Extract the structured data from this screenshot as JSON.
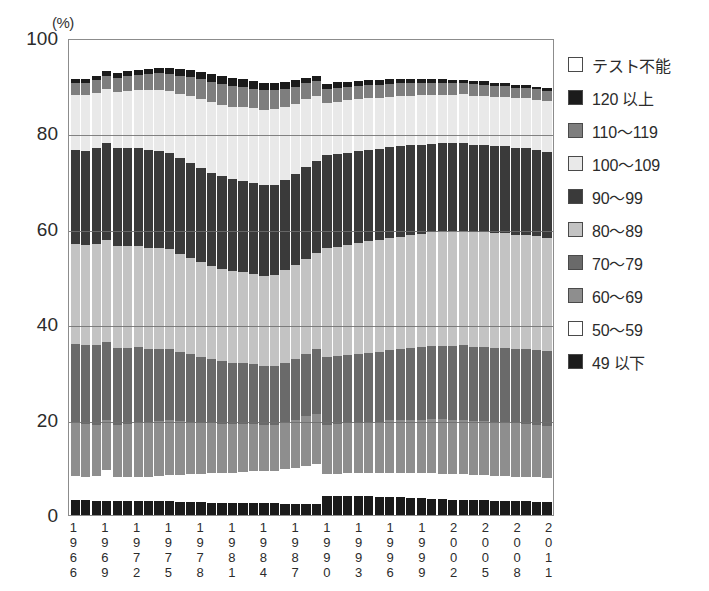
{
  "chart_data": {
    "type": "bar",
    "subtype": "stacked-100-percent",
    "title": "",
    "xlabel": "",
    "ylabel": "",
    "unit_label": "(%)",
    "ylim": [
      0,
      100
    ],
    "yticks": [
      0,
      20,
      40,
      60,
      80,
      100
    ],
    "ytick_labels": [
      "0",
      "20",
      "40",
      "60",
      "80",
      "100"
    ],
    "grid": true,
    "legend_position": "right",
    "x": [
      1966,
      1967,
      1968,
      1969,
      1970,
      1971,
      1972,
      1973,
      1974,
      1975,
      1976,
      1977,
      1978,
      1979,
      1980,
      1981,
      1982,
      1983,
      1984,
      1985,
      1986,
      1987,
      1988,
      1989,
      1990,
      1991,
      1992,
      1993,
      1994,
      1995,
      1996,
      1997,
      1998,
      1999,
      2000,
      2001,
      2002,
      2003,
      2004,
      2005,
      2006,
      2007,
      2008,
      2009,
      2010,
      2011
    ],
    "xtick_labels": [
      "1966",
      "1969",
      "1972",
      "1975",
      "1978",
      "1981",
      "1984",
      "1987",
      "1990",
      "1993",
      "1996",
      "1999",
      "2002",
      "2005",
      "2008",
      "2011"
    ],
    "xtick_indices": [
      0,
      3,
      6,
      9,
      12,
      15,
      18,
      21,
      24,
      27,
      30,
      33,
      36,
      39,
      42,
      45
    ],
    "series": [
      {
        "name": "49 以下",
        "key": "le49",
        "color": "#1b1b1b",
        "fill": "f-black",
        "values": [
          3.2,
          3.1,
          3.0,
          3.0,
          2.9,
          3.0,
          3.0,
          2.9,
          3.0,
          2.9,
          2.8,
          2.8,
          2.7,
          2.6,
          2.6,
          2.5,
          2.6,
          2.6,
          2.5,
          2.5,
          2.4,
          2.4,
          2.4,
          2.3,
          4.0,
          4.0,
          4.0,
          3.9,
          3.9,
          3.8,
          3.8,
          3.7,
          3.6,
          3.5,
          3.4,
          3.3,
          3.2,
          3.2,
          3.1,
          3.1,
          3.0,
          3.0,
          2.9,
          2.9,
          2.8,
          2.8
        ]
      },
      {
        "name": "50～59",
        "key": "r50_59",
        "color": "#ffffff",
        "fill": "f-white",
        "values": [
          5.1,
          5.0,
          5.2,
          6.5,
          5.0,
          5.0,
          5.1,
          5.2,
          5.3,
          5.5,
          5.6,
          5.8,
          6.0,
          6.2,
          6.3,
          6.4,
          6.5,
          6.6,
          6.7,
          6.8,
          7.2,
          7.6,
          8.0,
          8.4,
          4.6,
          4.7,
          4.8,
          4.9,
          5.0,
          5.0,
          5.1,
          5.2,
          5.3,
          5.3,
          5.4,
          5.4,
          5.4,
          5.4,
          5.3,
          5.3,
          5.2,
          5.2,
          5.2,
          5.1,
          5.1,
          5.0
        ]
      },
      {
        "name": "60～69",
        "key": "r60_69",
        "color": "#8e8e8e",
        "fill": "f-gray55",
        "values": [
          11.2,
          11.0,
          10.8,
          10.5,
          11.0,
          11.2,
          11.4,
          11.4,
          11.5,
          11.5,
          11.3,
          11.0,
          10.7,
          10.5,
          10.3,
          10.2,
          10.0,
          9.9,
          9.8,
          9.7,
          9.9,
          10.1,
          10.4,
          10.6,
          10.4,
          10.4,
          10.5,
          10.6,
          10.7,
          10.8,
          11.0,
          11.1,
          11.2,
          11.3,
          11.4,
          11.5,
          11.5,
          11.5,
          11.4,
          11.4,
          11.3,
          11.3,
          11.2,
          11.2,
          11.1,
          11.0
        ]
      },
      {
        "name": "70～79",
        "key": "r70_79",
        "color": "#6a6a6a",
        "fill": "f-midgray2",
        "values": [
          16.5,
          16.6,
          16.8,
          16.5,
          16.2,
          16.0,
          15.8,
          15.5,
          15.2,
          15.0,
          14.6,
          14.2,
          13.8,
          13.5,
          13.2,
          13.0,
          12.8,
          12.6,
          12.4,
          12.4,
          12.6,
          12.8,
          13.2,
          13.6,
          14.2,
          14.3,
          14.4,
          14.5,
          14.6,
          14.7,
          14.8,
          14.9,
          15.0,
          15.2,
          15.3,
          15.4,
          15.5,
          15.6,
          15.6,
          15.6,
          15.7,
          15.7,
          15.7,
          15.8,
          15.8,
          15.8
        ]
      },
      {
        "name": "80～89",
        "key": "r80_89",
        "color": "#c3c3c3",
        "fill": "f-lightgray",
        "values": [
          21.0,
          21.1,
          21.3,
          21.5,
          21.6,
          21.5,
          21.4,
          21.3,
          21.2,
          21.0,
          20.7,
          20.4,
          20.0,
          19.7,
          19.5,
          19.3,
          19.2,
          19.1,
          19.0,
          19.1,
          19.4,
          19.7,
          20.0,
          20.3,
          23.0,
          23.1,
          23.2,
          23.3,
          23.4,
          23.5,
          23.6,
          23.7,
          23.8,
          23.9,
          24.0,
          24.1,
          24.2,
          24.2,
          24.2,
          24.2,
          24.1,
          24.1,
          24.0,
          24.0,
          23.9,
          23.8
        ]
      },
      {
        "name": "90～99",
        "key": "r90_99",
        "color": "#3a3a3a",
        "fill": "f-dark2",
        "values": [
          19.8,
          19.9,
          20.1,
          20.3,
          20.5,
          20.6,
          20.6,
          20.6,
          20.5,
          20.4,
          20.2,
          20.0,
          19.8,
          19.6,
          19.5,
          19.4,
          19.3,
          19.2,
          19.1,
          19.0,
          19.0,
          19.1,
          19.2,
          19.3,
          19.5,
          19.5,
          19.4,
          19.4,
          19.3,
          19.2,
          19.1,
          19.0,
          18.9,
          18.8,
          18.7,
          18.6,
          18.5,
          18.5,
          18.4,
          18.4,
          18.3,
          18.3,
          18.2,
          18.2,
          18.1,
          18.1
        ]
      },
      {
        "name": "100～109",
        "key": "r100_109",
        "color": "#e9e9e9",
        "fill": "f-vlight",
        "values": [
          11.6,
          11.7,
          11.6,
          11.4,
          11.8,
          12.0,
          12.2,
          12.5,
          12.8,
          13.0,
          13.5,
          14.0,
          14.5,
          14.8,
          15.0,
          15.2,
          15.4,
          15.6,
          15.8,
          15.9,
          15.4,
          14.9,
          14.3,
          13.7,
          11.0,
          11.0,
          11.0,
          10.9,
          10.9,
          10.8,
          10.7,
          10.6,
          10.5,
          10.4,
          10.3,
          10.2,
          10.2,
          10.2,
          10.3,
          10.3,
          10.4,
          10.4,
          10.5,
          10.5,
          10.6,
          10.7
        ]
      },
      {
        "name": "110～119",
        "key": "r110_119",
        "color": "#7e7e7e",
        "fill": "f-midgray",
        "values": [
          2.6,
          2.6,
          2.7,
          2.8,
          3.0,
          3.1,
          3.2,
          3.4,
          3.5,
          3.6,
          3.8,
          4.0,
          4.2,
          4.3,
          4.4,
          4.4,
          4.3,
          4.2,
          4.1,
          4.0,
          3.8,
          3.6,
          3.4,
          3.2,
          3.0,
          3.0,
          2.9,
          2.9,
          2.8,
          2.8,
          2.7,
          2.7,
          2.6,
          2.6,
          2.5,
          2.5,
          2.4,
          2.4,
          2.4,
          2.3,
          2.3,
          2.3,
          2.2,
          2.2,
          2.2,
          2.1
        ]
      },
      {
        "name": "120 以上",
        "key": "ge120",
        "color": "#1b1b1b",
        "fill": "f-black",
        "values": [
          0.8,
          0.8,
          0.9,
          0.9,
          1.0,
          1.0,
          1.1,
          1.2,
          1.2,
          1.3,
          1.4,
          1.5,
          1.6,
          1.7,
          1.7,
          1.7,
          1.6,
          1.6,
          1.5,
          1.5,
          1.4,
          1.3,
          1.2,
          1.1,
          1.1,
          1.1,
          1.0,
          1.0,
          1.0,
          0.9,
          0.9,
          0.9,
          0.8,
          0.8,
          0.8,
          0.8,
          0.7,
          0.7,
          0.7,
          0.7,
          0.7,
          0.7,
          0.6,
          0.6,
          0.6,
          0.6
        ]
      },
      {
        "name": "テスト不能",
        "key": "untestable",
        "color": "#ffffff",
        "fill": "f-white",
        "values": [
          8.2,
          8.2,
          7.6,
          6.6,
          7.0,
          6.6,
          6.2,
          6.0,
          5.8,
          5.8,
          6.1,
          6.3,
          6.7,
          7.1,
          7.5,
          7.9,
          8.3,
          8.6,
          9.1,
          9.1,
          8.9,
          8.5,
          7.9,
          7.5,
          9.2,
          8.9,
          8.8,
          8.6,
          8.4,
          8.5,
          8.3,
          8.2,
          8.3,
          8.2,
          8.2,
          8.2,
          8.4,
          8.3,
          8.6,
          8.7,
          9.0,
          9.0,
          9.5,
          9.5,
          9.8,
          10.1
        ]
      }
    ]
  },
  "legend": {
    "items": [
      {
        "label": "テスト不能",
        "fill": "f-white"
      },
      {
        "label": "120 以上",
        "fill": "f-black"
      },
      {
        "label": "110～119",
        "fill": "f-midgray"
      },
      {
        "label": "100～109",
        "fill": "f-vlight"
      },
      {
        "label": "90～99",
        "fill": "f-dark2"
      },
      {
        "label": "80～89",
        "fill": "f-lightgray"
      },
      {
        "label": "70～79",
        "fill": "f-midgray2"
      },
      {
        "label": "60～69",
        "fill": "f-gray55"
      },
      {
        "label": "50～59",
        "fill": "f-white"
      },
      {
        "label": "49 以下",
        "fill": "f-black"
      }
    ]
  }
}
